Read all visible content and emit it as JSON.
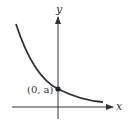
{
  "diagram": {
    "type": "function-graph",
    "x_axis_label": "x",
    "y_axis_label": "y",
    "point_label": "(0, a)",
    "colors": {
      "curve": "#333333",
      "axis": "#333333",
      "background": "#ffffff"
    }
  }
}
